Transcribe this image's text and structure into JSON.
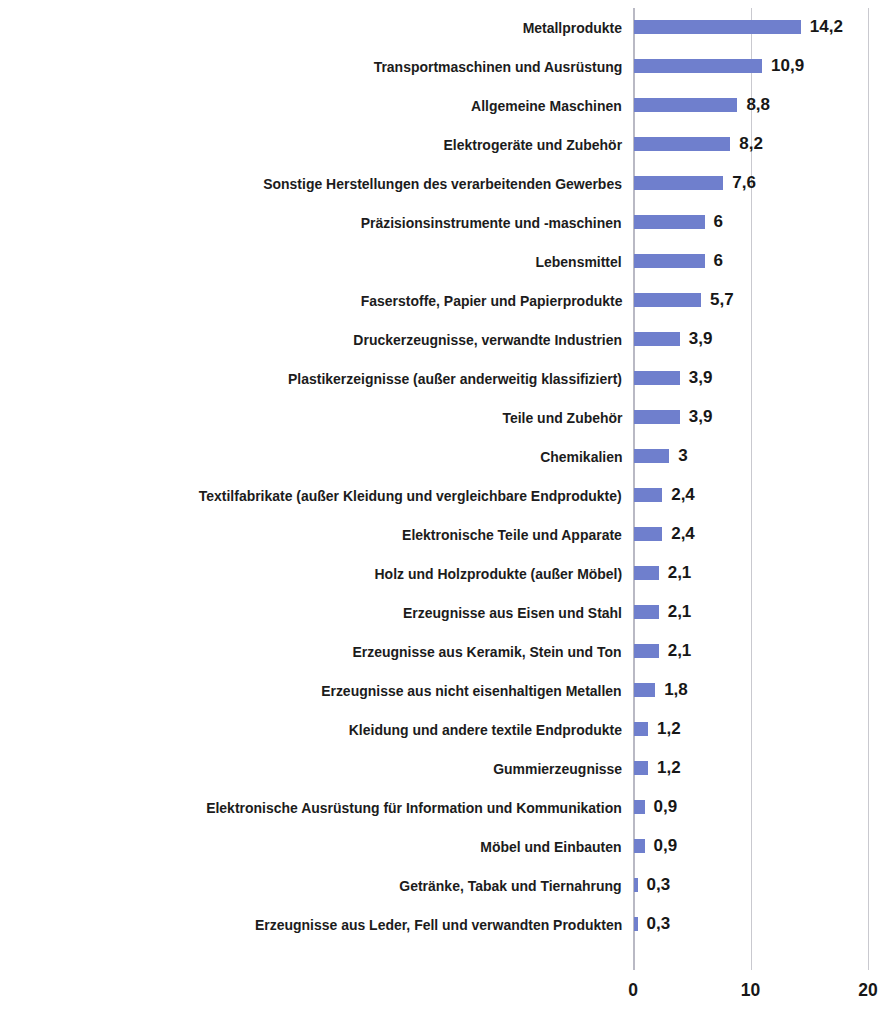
{
  "chart_data": {
    "type": "bar",
    "orientation": "horizontal",
    "title": "",
    "subtitle": "",
    "xlabel": "",
    "ylabel": "",
    "xlim": [
      0,
      20
    ],
    "xticks": [
      "0",
      "10",
      "20"
    ],
    "xtick_values": [
      0,
      10,
      20
    ],
    "grid": true,
    "legend": null,
    "value_label_decimal_separator": ",",
    "bar_color": "#6f7fcd",
    "gridline_color": "#c9c9cf",
    "text_color": "#1c1c1c",
    "categories": [
      "Metallprodukte",
      "Transportmaschinen und Ausrüstung",
      "Allgemeine Maschinen",
      "Elektrogeräte und Zubehör",
      "Sonstige Herstellungen des verarbeitenden Gewerbes",
      "Präzisionsinstrumente und -maschinen",
      "Lebensmittel",
      "Faserstoffe, Papier und Papierprodukte",
      "Druckerzeugnisse, verwandte Industrien",
      "Plastikerzeignisse (außer anderweitig klassifiziert)",
      "Teile und Zubehör",
      "Chemikalien",
      "Textilfabrikate (außer Kleidung und vergleichbare Endprodukte)",
      "Elektronische Teile und Apparate",
      "Holz und Holzprodukte (außer Möbel)",
      "Erzeugnisse aus Eisen und Stahl",
      "Erzeugnisse aus Keramik, Stein und Ton",
      "Erzeugnisse aus nicht eisenhaltigen Metallen",
      "Kleidung und andere textile Endprodukte",
      "Gummierzeugnisse",
      "Elektronische Ausrüstung für Information und Kommunikation",
      "Möbel und Einbauten",
      "Getränke, Tabak und Tiernahrung",
      "Erzeugnisse aus Leder, Fell und verwandten Produkten"
    ],
    "values": [
      14.2,
      10.9,
      8.8,
      8.2,
      7.6,
      6,
      6,
      5.7,
      3.9,
      3.9,
      3.9,
      3,
      2.4,
      2.4,
      2.1,
      2.1,
      2.1,
      1.8,
      1.2,
      1.2,
      0.9,
      0.9,
      0.3,
      0.3
    ],
    "value_labels": [
      "14,2",
      "10,9",
      "8,8",
      "8,2",
      "7,6",
      "6",
      "6",
      "5,7",
      "3,9",
      "3,9",
      "3,9",
      "3",
      "2,4",
      "2,4",
      "2,1",
      "2,1",
      "2,1",
      "1,8",
      "1,2",
      "1,2",
      "0,9",
      "0,9",
      "0,3",
      "0,3"
    ]
  }
}
